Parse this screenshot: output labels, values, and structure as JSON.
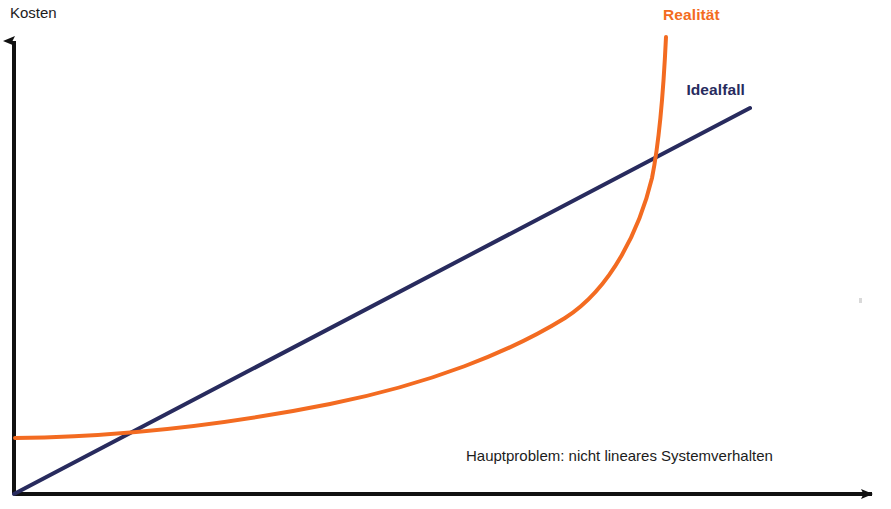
{
  "figure": {
    "width": 891,
    "height": 509,
    "background": "#ffffff",
    "axis_color": "#111111"
  },
  "chart_data": {
    "type": "line",
    "title": "",
    "subtitle": "",
    "ylabel": "Kosten",
    "xlabel": "",
    "grid": false,
    "legend_position": "inline-end-of-line",
    "axes": {
      "y_axis_label": "Kosten",
      "x_axis_label": "",
      "arrows": true,
      "ticks": [],
      "tick_labels": [],
      "origin_px": [
        14,
        494
      ],
      "x_axis_end_px": [
        885,
        494
      ],
      "y_axis_top_px": [
        14,
        33
      ]
    },
    "annotations": [
      {
        "name": "hauptproblem-note",
        "text": "Hauptproblem: nicht lineares Systemverhalten",
        "color": "#1c1c1c",
        "x_px": 466,
        "y_px": 461
      }
    ],
    "series": [
      {
        "name": "Idealfall",
        "label": "Idealfall",
        "color": "#282b5e",
        "shape": "linear",
        "stroke_width": 4,
        "label_px": [
          745,
          95
        ],
        "points_px": [
          [
            14,
            494
          ],
          [
            110,
            452
          ],
          [
            200,
            413
          ],
          [
            300,
            369
          ],
          [
            400,
            325
          ],
          [
            500,
            281
          ],
          [
            600,
            238
          ],
          [
            680,
            203
          ],
          [
            750,
            108
          ]
        ],
        "path_d": "M 14 494 L 750 108"
      },
      {
        "name": "Realität",
        "label": "Realität",
        "color": "#f36b21",
        "shape": "exponential",
        "stroke_width": 4,
        "label_px": [
          663,
          20
        ],
        "points_px": [
          [
            15,
            438
          ],
          [
            80,
            436
          ],
          [
            140,
            432
          ],
          [
            200,
            426
          ],
          [
            260,
            418
          ],
          [
            320,
            409
          ],
          [
            380,
            396
          ],
          [
            430,
            383
          ],
          [
            480,
            367
          ],
          [
            520,
            350
          ],
          [
            560,
            328
          ],
          [
            590,
            306
          ],
          [
            615,
            280
          ],
          [
            635,
            248
          ],
          [
            650,
            205
          ],
          [
            660,
            150
          ],
          [
            666,
            37
          ]
        ],
        "path_d": "M 15 438 C 120 437 230 424 330 404 C 430 384 510 352 565 318 C 612 288 640 228 652 178 C 660 138 664 80 666 37"
      }
    ],
    "crossings_px": [
      [
        133,
        431
      ],
      [
        593,
        186
      ]
    ]
  },
  "decorations": {
    "speck": {
      "x_px": 860,
      "y_px": 299,
      "color": "#b9b9b9"
    }
  }
}
